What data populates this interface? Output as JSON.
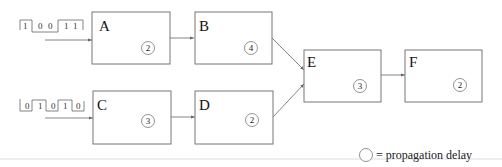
{
  "diagram": {
    "inputs": [
      {
        "id": "in1",
        "bits": [
          "1",
          "0",
          "0",
          "1",
          "1"
        ],
        "target": "A"
      },
      {
        "id": "in2",
        "bits": [
          "0",
          "1",
          "0",
          "1",
          "0"
        ],
        "target": "C"
      }
    ],
    "blocks": [
      {
        "id": "A",
        "label": "A",
        "delay": "2"
      },
      {
        "id": "B",
        "label": "B",
        "delay": "4"
      },
      {
        "id": "C",
        "label": "C",
        "delay": "3"
      },
      {
        "id": "D",
        "label": "D",
        "delay": "2"
      },
      {
        "id": "E",
        "label": "E",
        "delay": "3"
      },
      {
        "id": "F",
        "label": "F",
        "delay": "2"
      }
    ],
    "edges": [
      [
        "A",
        "B"
      ],
      [
        "C",
        "D"
      ],
      [
        "B",
        "E"
      ],
      [
        "D",
        "E"
      ],
      [
        "E",
        "F"
      ]
    ],
    "legend": {
      "text": "= propagation delay"
    }
  }
}
